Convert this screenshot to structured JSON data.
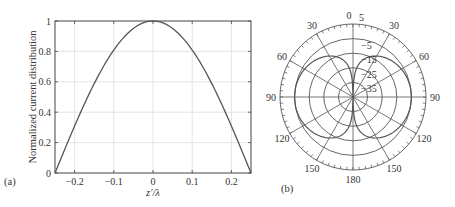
{
  "chart_data": [
    {
      "panel": "(a)",
      "type": "line",
      "title": "",
      "xlabel": "z′/λ",
      "ylabel": "Normalized current distribution",
      "xlim": [
        -0.25,
        0.25
      ],
      "ylim": [
        0,
        1
      ],
      "xticks": [
        -0.2,
        -0.1,
        0,
        0.1,
        0.2
      ],
      "xtick_labels": [
        "−0.2",
        "−0.1",
        "0",
        "0.1",
        "0.2"
      ],
      "yticks": [
        0,
        0.2,
        0.4,
        0.6,
        0.8,
        1
      ],
      "ytick_labels": [
        "0",
        "0.2",
        "0.4",
        "0.6",
        "0.8",
        "1"
      ],
      "grid": true,
      "series": [
        {
          "name": "current",
          "x": [
            -0.25,
            -0.2,
            -0.15,
            -0.1,
            -0.05,
            0,
            0.05,
            0.1,
            0.15,
            0.2,
            0.25
          ],
          "y": [
            0,
            0.31,
            0.59,
            0.81,
            0.95,
            1,
            0.95,
            0.81,
            0.59,
            0.31,
            0
          ]
        }
      ]
    },
    {
      "panel": "(b)",
      "type": "polar",
      "title": "",
      "angle_labels": [
        "0",
        "30",
        "60",
        "90",
        "120",
        "150",
        "180",
        "150",
        "120",
        "90",
        "60",
        "30"
      ],
      "radial_labels": [
        "5",
        "−5",
        "−15",
        "−25",
        "−35"
      ],
      "radial_range_db": [
        -45,
        5
      ],
      "grid": true,
      "series": [
        {
          "name": "radiation pattern (dB)",
          "theta_deg": [
            0,
            15,
            30,
            45,
            60,
            75,
            90,
            105,
            120,
            135,
            150,
            165,
            180
          ],
          "r_db": [
            -45,
            -24,
            -14,
            -9,
            -6.5,
            -5.3,
            -5,
            -5.3,
            -6.5,
            -9,
            -14,
            -24,
            -45
          ]
        }
      ]
    }
  ],
  "panels": {
    "a_label": "(a)",
    "b_label": "(b)"
  }
}
